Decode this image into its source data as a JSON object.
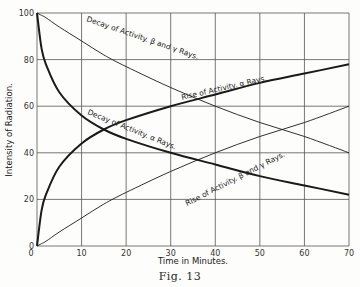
{
  "chart_data": {
    "type": "line",
    "title": "",
    "caption": "Fig. 13",
    "xlabel": "Time in Minutes.",
    "ylabel": "Intensity of Radiation.",
    "xlim": [
      0,
      70
    ],
    "ylim": [
      0,
      100
    ],
    "xticks": [
      0,
      10,
      20,
      30,
      40,
      50,
      60,
      70
    ],
    "yticks": [
      0,
      20,
      40,
      60,
      80,
      100
    ],
    "grid": true,
    "legend": "none (curves labeled inline)",
    "x": [
      0,
      1,
      2,
      5,
      10,
      15,
      20,
      30,
      40,
      50,
      60,
      70
    ],
    "series": [
      {
        "name": "Decay of Activity, β and γ Rays",
        "style": "thin",
        "values": [
          100,
          99,
          98,
          94,
          88,
          82,
          77,
          68,
          60,
          53,
          47,
          40
        ]
      },
      {
        "name": "Rise of Activity, β and γ Rays",
        "style": "thin",
        "values": [
          0,
          1,
          2,
          6,
          12,
          18,
          23,
          32,
          40,
          47,
          53,
          60
        ]
      },
      {
        "name": "Decay of Activity, α Rays",
        "style": "thick",
        "values": [
          100,
          85,
          78,
          66,
          56,
          50,
          46,
          40,
          35,
          30,
          26,
          22
        ]
      },
      {
        "name": "Rise of Activity, α Rays",
        "style": "thick",
        "values": [
          0,
          15,
          22,
          34,
          44,
          50,
          54,
          60,
          65,
          70,
          74,
          78
        ]
      }
    ],
    "annotations": [
      "Decay of Activity, β and γ Rays.",
      "Rise of Activity, α Rays.",
      "Decay of Activity, α Rays.",
      "Rise of Activity, β and γ Rays."
    ]
  },
  "labels": {
    "xlabel": "Time in Minutes.",
    "ylabel": "Intensity of Radiation.",
    "caption": "Fig. 13",
    "ann_decay_bg": "Decay of Activity. β and γ Rays.",
    "ann_rise_a": "Rise of Activity. α Rays.",
    "ann_decay_a": "Decay of Activity. α Rays.",
    "ann_rise_bg": "Rise of Activity. β and γ Rays."
  }
}
